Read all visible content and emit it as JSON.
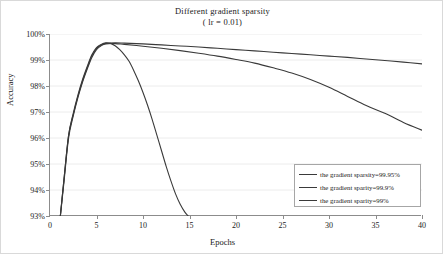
{
  "chart_data": {
    "type": "line",
    "title": "Different gradient sparsity",
    "subtitle": "( lr = 0.01)",
    "xlabel": "Epochs",
    "ylabel": "Accuracy",
    "xlim": [
      0,
      40
    ],
    "ylim": [
      93,
      100
    ],
    "xticks": [
      "0",
      "5",
      "10",
      "15",
      "20",
      "25",
      "30",
      "35",
      "40"
    ],
    "yticks": [
      "93%",
      "94%",
      "95%",
      "96%",
      "97%",
      "98%",
      "99%",
      "100%"
    ],
    "grid": "horizontal",
    "legend_position": "lower-right",
    "line_color": "#3a3a3a",
    "grid_color": "#ececec",
    "axis_color": "#8c8c8c",
    "series": [
      {
        "name": "the gradient sparsity=99.95%",
        "x": [
          1,
          1.5,
          2,
          2.5,
          3,
          3.5,
          4,
          4.5,
          5,
          5.5,
          6,
          7,
          8,
          10,
          12,
          14,
          16,
          18,
          20,
          22,
          24,
          26,
          28,
          30,
          32,
          34,
          36,
          38,
          40
        ],
        "y": [
          92.6,
          94.4,
          96.1,
          96.9,
          97.6,
          98.2,
          98.7,
          99.15,
          99.45,
          99.58,
          99.64,
          99.66,
          99.65,
          99.62,
          99.58,
          99.54,
          99.5,
          99.45,
          99.4,
          99.35,
          99.3,
          99.25,
          99.2,
          99.15,
          99.1,
          99.04,
          98.98,
          98.92,
          98.85
        ]
      },
      {
        "name": "the gradient sparsity=99.9%",
        "x": [
          1,
          1.5,
          2,
          2.5,
          3,
          3.5,
          4,
          4.5,
          5,
          5.5,
          6,
          7,
          8,
          10,
          12,
          14,
          16,
          18,
          20,
          22,
          24,
          26,
          28,
          30,
          32,
          34,
          36,
          38,
          40
        ],
        "y": [
          92.6,
          94.3,
          96.0,
          96.85,
          97.55,
          98.15,
          98.65,
          99.1,
          99.4,
          99.55,
          99.62,
          99.63,
          99.6,
          99.53,
          99.45,
          99.36,
          99.26,
          99.15,
          99.02,
          98.88,
          98.7,
          98.5,
          98.25,
          97.95,
          97.6,
          97.25,
          96.95,
          96.6,
          96.3
        ]
      },
      {
        "name": "the gradient sparsity=99%",
        "x": [
          1,
          1.5,
          2,
          2.5,
          3,
          3.5,
          4,
          4.5,
          5,
          5.5,
          6,
          6.5,
          7,
          7.5,
          8,
          8.5,
          9,
          9.5,
          10,
          10.5,
          11,
          11.5,
          12,
          12.5,
          13,
          13.5,
          14,
          14.5,
          15,
          15.4,
          15.7
        ],
        "y": [
          92.6,
          94.4,
          96.1,
          96.95,
          97.65,
          98.25,
          98.75,
          99.2,
          99.48,
          99.6,
          99.66,
          99.64,
          99.55,
          99.4,
          99.2,
          98.95,
          98.6,
          98.2,
          97.75,
          97.25,
          96.7,
          96.1,
          95.5,
          94.9,
          94.35,
          93.85,
          93.45,
          93.15,
          92.95,
          92.85,
          92.8
        ]
      }
    ]
  },
  "legend": {
    "items": [
      "the gradient sparsity=99.95%",
      "the gradient sparity=99.9%",
      "the gradient sparity=99%"
    ]
  }
}
